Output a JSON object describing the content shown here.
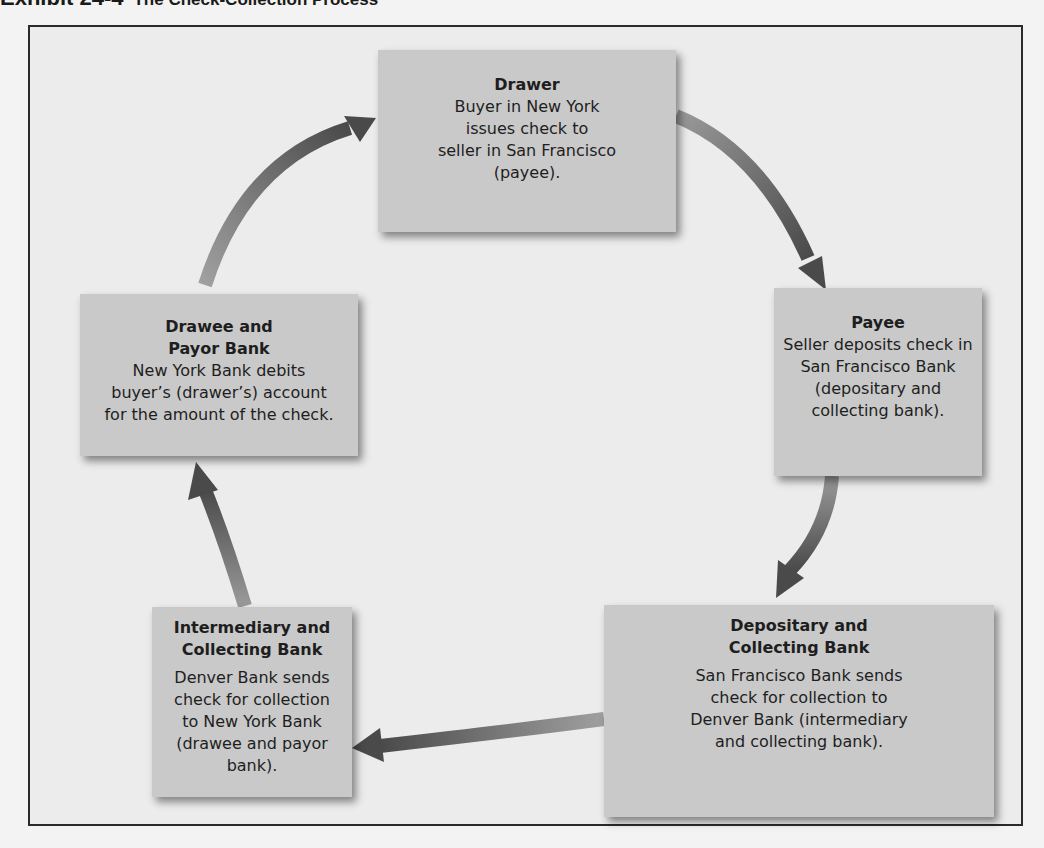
{
  "exhibit": {
    "label": "Exhibit 24-4",
    "title": "The Check-Collection Process"
  },
  "nodes": [
    {
      "id": "drawer",
      "heading": [
        "Drawer"
      ],
      "body": [
        "Buyer in New York",
        "issues check to",
        "seller in San Francisco",
        "(payee)."
      ]
    },
    {
      "id": "payee",
      "heading": [
        "Payee"
      ],
      "body": [
        "Seller deposits check in",
        "San Francisco Bank",
        "(depositary and",
        "collecting bank)."
      ]
    },
    {
      "id": "depositary",
      "heading": [
        "Depositary and",
        "Collecting Bank"
      ],
      "body": [
        "San Francisco Bank sends",
        "check for collection to",
        "Denver Bank (intermediary",
        "and collecting bank)."
      ]
    },
    {
      "id": "intermediary",
      "heading": [
        "Intermediary and",
        "Collecting Bank"
      ],
      "body": [
        "Denver Bank sends",
        "check for collection",
        "to New York Bank",
        "(drawee and payor bank)."
      ]
    },
    {
      "id": "drawee",
      "heading": [
        "Drawee and",
        "Payor Bank"
      ],
      "body": [
        "New York Bank debits",
        "buyer’s (drawer’s) account",
        "for the amount of the check."
      ]
    }
  ],
  "flow": [
    {
      "from": "drawer",
      "to": "payee"
    },
    {
      "from": "payee",
      "to": "depositary"
    },
    {
      "from": "depositary",
      "to": "intermediary"
    },
    {
      "from": "intermediary",
      "to": "drawee"
    },
    {
      "from": "drawee",
      "to": "drawer"
    }
  ],
  "colors": {
    "box_fill": "#c9c9c9",
    "arrow": "#5a5a5a",
    "frame_border": "#2a2a2a",
    "background": "#ececec"
  }
}
